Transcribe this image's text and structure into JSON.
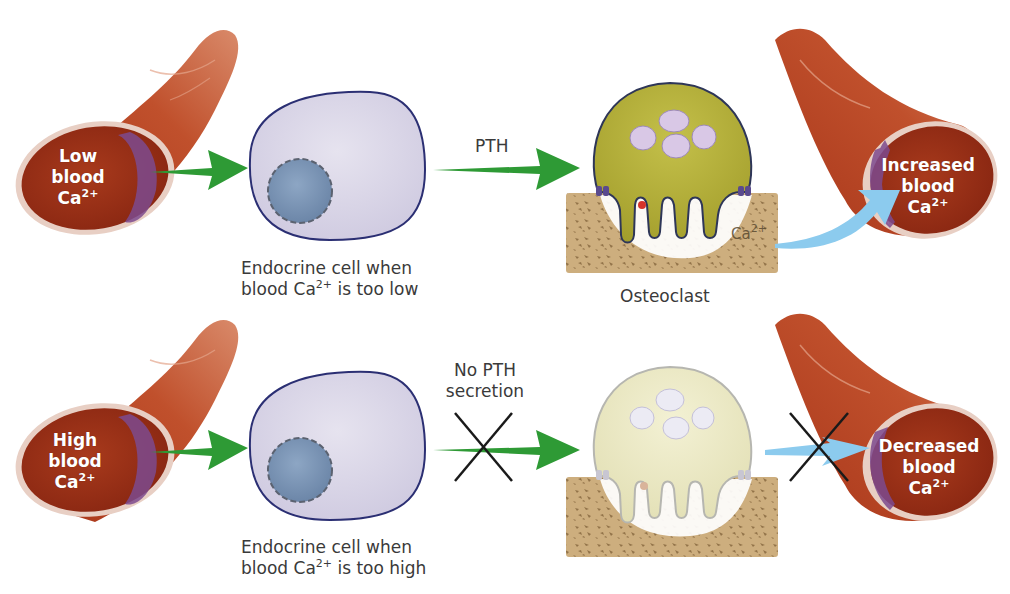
{
  "diagram": {
    "colors": {
      "vessel": "#b8401f",
      "vessel_dark": "#8e2a16",
      "vessel_lumen": "#9d3217",
      "vessel_wall_inner": "#7d4a8e",
      "endocrine_cell": "#d9d5e6",
      "endocrine_outline": "#2b2f73",
      "nucleus": "#7d95b4",
      "osteoclast_active": "#b5b03c",
      "osteoclast_inactive": "#ece9c3",
      "osteoclast_outline": "#2e3658",
      "bone": "#c9a978",
      "green_arrow": "#2e9a35",
      "blue_arrow": "#7fc4ea",
      "x_mark": "#1a1a1a"
    },
    "top_row": {
      "vessel_label": {
        "line1": "Low",
        "line2": "blood",
        "line3": "Ca",
        "sup": "2+"
      },
      "endocrine_caption": {
        "line1": "Endocrine cell when",
        "line2_pre": "blood Ca",
        "sup": "2+",
        "line2_post": " is too low"
      },
      "arrow_label": "PTH",
      "osteoclast_caption": "Osteoclast",
      "bone_ion": {
        "text": "Ca",
        "sup": "2+"
      },
      "result_vessel_label": {
        "line1": "Increased",
        "line2": "blood",
        "line3": "Ca",
        "sup": "2+"
      }
    },
    "bottom_row": {
      "vessel_label": {
        "line1": "High",
        "line2": "blood",
        "line3": "Ca",
        "sup": "2+"
      },
      "endocrine_caption": {
        "line1": "Endocrine cell when",
        "line2_pre": "blood Ca",
        "sup": "2+",
        "line2_post": " is too high"
      },
      "arrow_label": {
        "line1": "No PTH",
        "line2": "secretion"
      },
      "result_vessel_label": {
        "line1": "Decreased",
        "line2": "blood",
        "line3": "Ca",
        "sup": "2+"
      }
    }
  }
}
